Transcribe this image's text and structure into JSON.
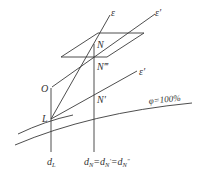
{
  "diagram": {
    "type": "psychrometric-construction",
    "labels": {
      "epsilon": "ε",
      "epsilon_prime_upper": "ε′",
      "epsilon_prime_lower": "ε′",
      "N": "N",
      "N_triple_prime": "N‴",
      "N_prime": "N′",
      "O": "O",
      "L": "L",
      "phi_curve": "φ=100%",
      "d_L_main": "d",
      "d_L_sub": "L",
      "d_N_expr_main": "d",
      "d_N_expr_sub1": "N",
      "d_N_expr_eq1": "=d",
      "d_N_expr_sub2": "N",
      "d_N_expr_sup2": "′",
      "d_N_expr_eq2": "=d",
      "d_N_expr_sub3": "N",
      "d_N_expr_sup3": "″"
    },
    "stroke_color": "#3a3a3a",
    "text_color": "#333333"
  }
}
